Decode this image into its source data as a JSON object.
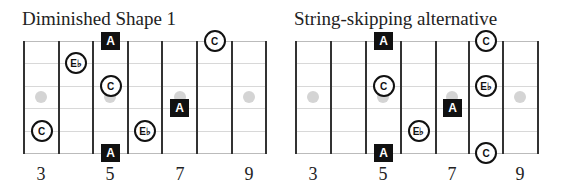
{
  "diagrams": [
    {
      "title": "Diminished Shape 1",
      "left": 24,
      "frets_x": [
        24,
        59,
        93,
        128,
        162,
        197,
        232,
        266
      ],
      "fret_labels": [
        {
          "label": "3",
          "x": 41
        },
        {
          "label": "5",
          "x": 110
        },
        {
          "label": "7",
          "x": 180
        },
        {
          "label": "9",
          "x": 249
        }
      ],
      "inlay_dots_x": [
        41,
        110,
        180,
        249
      ],
      "notes": [
        {
          "note": "A",
          "shape": "square",
          "fret": 5,
          "string": 1
        },
        {
          "note": "C",
          "shape": "circle",
          "fret": 8,
          "string": 1
        },
        {
          "note": "E♭",
          "shape": "circle",
          "fret": 4,
          "string": 2
        },
        {
          "note": "C",
          "shape": "circle",
          "fret": 5,
          "string": 3
        },
        {
          "note": "A",
          "shape": "square",
          "fret": 7,
          "string": 4
        },
        {
          "note": "E♭",
          "shape": "circle",
          "fret": 6,
          "string": 5
        },
        {
          "note": "C",
          "shape": "circle",
          "fret": 3,
          "string": 5
        },
        {
          "note": "A",
          "shape": "square",
          "fret": 5,
          "string": 6
        }
      ]
    },
    {
      "title": "String-skipping alternative",
      "left": 296,
      "frets_x": [
        296,
        331,
        366,
        401,
        436,
        469,
        503,
        538
      ],
      "fret_labels": [
        {
          "label": "3",
          "x": 313
        },
        {
          "label": "5",
          "x": 383
        },
        {
          "label": "7",
          "x": 452
        },
        {
          "label": "9",
          "x": 520
        }
      ],
      "inlay_dots_x": [
        313,
        383,
        452,
        520
      ],
      "notes": [
        {
          "note": "A",
          "shape": "square",
          "fret": 5,
          "string": 1
        },
        {
          "note": "C",
          "shape": "circle",
          "fret": 8,
          "string": 1
        },
        {
          "note": "C",
          "shape": "circle",
          "fret": 5,
          "string": 3
        },
        {
          "note": "E♭",
          "shape": "circle",
          "fret": 8,
          "string": 3
        },
        {
          "note": "A",
          "shape": "square",
          "fret": 7,
          "string": 4
        },
        {
          "note": "E♭",
          "shape": "circle",
          "fret": 6,
          "string": 5
        },
        {
          "note": "A",
          "shape": "square",
          "fret": 5,
          "string": 6
        },
        {
          "note": "C",
          "shape": "circle",
          "fret": 8,
          "string": 6
        }
      ]
    }
  ],
  "strings_y": [
    41,
    63,
    86,
    108,
    131,
    153
  ],
  "dots_y": 97
}
